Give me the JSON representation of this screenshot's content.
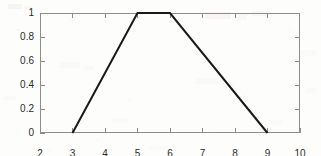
{
  "chart_data": {
    "type": "line",
    "title": "",
    "subtitle": "",
    "xlabel": "",
    "ylabel": "",
    "xlim": [
      2,
      10
    ],
    "ylim": [
      0,
      1
    ],
    "grid": false,
    "legend": null,
    "xticks": [
      2,
      3,
      4,
      5,
      6,
      7,
      8,
      9,
      10
    ],
    "xtick_labels": [
      "2",
      "3",
      "4",
      "5",
      "6",
      "7",
      "8",
      "9",
      "10"
    ],
    "yticks": [
      0,
      0.2,
      0.4,
      0.6,
      0.8,
      1
    ],
    "ytick_labels": [
      "0",
      "0.2",
      "0.4",
      "0.6",
      "0.8",
      "1"
    ],
    "series": [
      {
        "name": "trapezoidal membership function",
        "color": "#1a1a1a",
        "line_width": 2,
        "x": [
          3,
          5,
          6,
          9
        ],
        "y": [
          0,
          1,
          1,
          0
        ],
        "points": [
          {
            "x": 3,
            "y": 0
          },
          {
            "x": 5,
            "y": 1
          },
          {
            "x": 6,
            "y": 1
          },
          {
            "x": 9,
            "y": 0
          }
        ]
      }
    ],
    "annotations": []
  },
  "figure": {
    "axis_color": "#8e8e8e",
    "tick_color": "#8e8e8e",
    "label_color": "#2b2b2b",
    "background_color": "#fdfdfc",
    "curve_color": "#1a1a1a"
  }
}
